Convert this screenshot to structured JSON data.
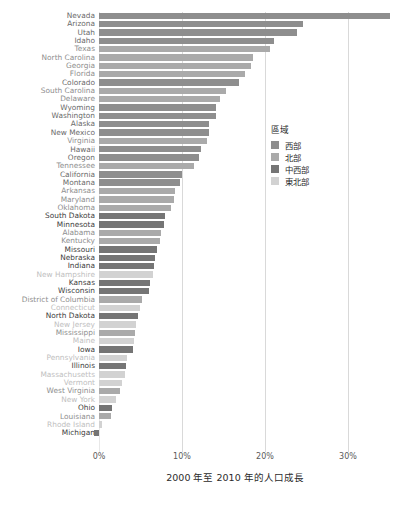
{
  "chart_data": {
    "type": "bar",
    "orientation": "horizontal",
    "title": "",
    "xlabel": "2000 年至 2010 年的人口成長",
    "ylabel": "",
    "xlim": [
      -1,
      36
    ],
    "xticks": [
      0,
      10,
      20,
      30
    ],
    "xticklabels": [
      "0%",
      "10%",
      "20%",
      "30%"
    ],
    "grid": "vertical",
    "legend": {
      "title": "區域",
      "position": "right",
      "entries": [
        {
          "label": "西部",
          "color": "#8e8e8e"
        },
        {
          "label": "北部",
          "color": "#aaaaaa"
        },
        {
          "label": "中西部",
          "color": "#757575"
        },
        {
          "label": "東北部",
          "color": "#d2d2d2"
        }
      ]
    },
    "categories": [
      "Nevada",
      "Arizona",
      "Utah",
      "Idaho",
      "Texas",
      "North Carolina",
      "Georgia",
      "Florida",
      "Colorado",
      "South Carolina",
      "Delaware",
      "Wyoming",
      "Washington",
      "Alaska",
      "New Mexico",
      "Virginia",
      "Hawaii",
      "Oregon",
      "Tennessee",
      "California",
      "Montana",
      "Arkansas",
      "Maryland",
      "Oklahoma",
      "South Dakota",
      "Minnesota",
      "Alabama",
      "Kentucky",
      "Missouri",
      "Nebraska",
      "Indiana",
      "New Hampshire",
      "Kansas",
      "Wisconsin",
      "District of Columbia",
      "Connecticut",
      "North Dakota",
      "New Jersey",
      "Mississippi",
      "Maine",
      "Iowa",
      "Pennsylvania",
      "Illinois",
      "Massachusetts",
      "Vermont",
      "West Virginia",
      "New York",
      "Ohio",
      "Louisiana",
      "Rhode Island",
      "Michigan"
    ],
    "values": [
      35.1,
      24.6,
      23.8,
      21.1,
      20.6,
      18.5,
      18.3,
      17.6,
      16.9,
      15.3,
      14.6,
      14.1,
      14.1,
      13.3,
      13.2,
      13.0,
      12.3,
      12.0,
      11.5,
      10.0,
      9.7,
      9.1,
      9.0,
      8.7,
      7.9,
      7.8,
      7.5,
      7.4,
      7.0,
      6.7,
      6.6,
      6.5,
      6.1,
      6.0,
      5.2,
      4.9,
      4.7,
      4.5,
      4.3,
      4.2,
      4.1,
      3.4,
      3.3,
      3.1,
      2.8,
      2.5,
      2.1,
      1.6,
      1.4,
      0.4,
      -0.6
    ],
    "regions": [
      "west",
      "west",
      "west",
      "west",
      "south",
      "south",
      "south",
      "south",
      "west",
      "south",
      "south",
      "west",
      "west",
      "west",
      "west",
      "south",
      "west",
      "west",
      "south",
      "west",
      "west",
      "south",
      "south",
      "south",
      "midwest",
      "midwest",
      "south",
      "south",
      "midwest",
      "midwest",
      "midwest",
      "northeast",
      "midwest",
      "midwest",
      "south",
      "northeast",
      "midwest",
      "northeast",
      "south",
      "northeast",
      "midwest",
      "northeast",
      "midwest",
      "northeast",
      "northeast",
      "south",
      "northeast",
      "midwest",
      "south",
      "northeast",
      "midwest"
    ],
    "region_colors": {
      "west": "#8e8e8e",
      "south": "#aaaaaa",
      "midwest": "#757575",
      "northeast": "#d2d2d2"
    },
    "label_colors": {
      "west": "#6a6a6a",
      "south": "#8e8e8e",
      "midwest": "#3d3d3d",
      "northeast": "#c0c0c0"
    }
  }
}
